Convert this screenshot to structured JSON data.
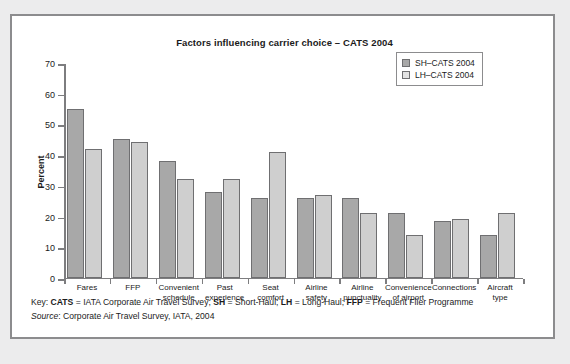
{
  "panel": {
    "title": "Factors influencing carrier choice  –  CATS 2004"
  },
  "legend": {
    "items": [
      {
        "label": "SH–CATS 2004",
        "color": "#a8a8a8",
        "swatch": "sh"
      },
      {
        "label": "LH–CATS 2004",
        "color": "#e2e2e2",
        "swatch": "lh"
      }
    ]
  },
  "footer": {
    "key_prefix": "Key: ",
    "key_b1": "CATS",
    "key_t1": " = IATA Corporate Air Travel Survey; ",
    "key_b2": "SH",
    "key_t2": " = Short-Haul; ",
    "key_b3": "LH",
    "key_t3": " = Long-Haul; ",
    "key_b4": "FFP",
    "key_t4": " = Frequent Flier Programme",
    "source_label": "Source",
    "source_text": ": Corporate Air Travel Survey, IATA, 2004"
  },
  "chart_data": {
    "type": "bar",
    "title": "Factors influencing carrier choice – CATS 2004",
    "xlabel": "",
    "ylabel": "Percent",
    "ylim": [
      0,
      70
    ],
    "yticks": [
      0,
      10,
      20,
      30,
      40,
      50,
      60,
      70
    ],
    "grid": false,
    "legend_position": "top-right",
    "categories": [
      "Fares",
      "FFP",
      "Convenient schedule",
      "Past experience",
      "Seat comfort",
      "Airline safety",
      "Airline punctuality",
      "Convenience of airport",
      "Connections",
      "Aircraft type"
    ],
    "category_lines": [
      [
        "Fares"
      ],
      [
        "FFP"
      ],
      [
        "Convenient",
        "schedule"
      ],
      [
        "Past",
        "experience"
      ],
      [
        "Seat",
        "comfort"
      ],
      [
        "Airline",
        "safety"
      ],
      [
        "Airline",
        "punctuality"
      ],
      [
        "Convenience",
        "of airport"
      ],
      [
        "Connections"
      ],
      [
        "Aircraft",
        "type"
      ]
    ],
    "series": [
      {
        "name": "SH–CATS 2004",
        "color": "#a8a8a8",
        "values": [
          55,
          45,
          38,
          28,
          26,
          26,
          26,
          21,
          18.5,
          14
        ]
      },
      {
        "name": "LH–CATS 2004",
        "color": "#cfcfcf",
        "values": [
          42,
          44,
          32,
          32,
          41,
          27,
          21,
          14,
          19,
          21
        ]
      }
    ]
  }
}
